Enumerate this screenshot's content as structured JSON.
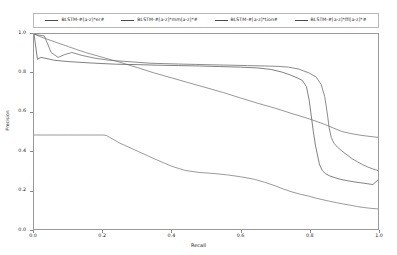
{
  "chart_data": {
    "type": "line",
    "title": "",
    "xlabel": "Recall",
    "ylabel": "Precision",
    "xlim": [
      0.0,
      1.0
    ],
    "ylim": [
      0.0,
      1.0
    ],
    "xticks": [
      "0.0",
      "0.2",
      "0.4",
      "0.6",
      "0.8",
      "1.0"
    ],
    "yticks": [
      "0.0",
      "0.2",
      "0.4",
      "0.6",
      "0.8",
      "1.0"
    ],
    "grid": false,
    "legend_position": "upper-center-outside",
    "series": [
      {
        "name": "BLSTM-#[a-z]*er#",
        "color": "#4a4a4a",
        "points": [
          [
            0.0,
            1.0
          ],
          [
            0.01,
            0.87
          ],
          [
            0.02,
            0.88
          ],
          [
            0.035,
            0.875
          ],
          [
            0.06,
            0.865
          ],
          [
            0.09,
            0.86
          ],
          [
            0.13,
            0.855
          ],
          [
            0.18,
            0.85
          ],
          [
            0.24,
            0.845
          ],
          [
            0.3,
            0.843
          ],
          [
            0.36,
            0.84
          ],
          [
            0.42,
            0.838
          ],
          [
            0.48,
            0.836
          ],
          [
            0.54,
            0.833
          ],
          [
            0.6,
            0.83
          ],
          [
            0.65,
            0.826
          ],
          [
            0.69,
            0.818
          ],
          [
            0.72,
            0.805
          ],
          [
            0.745,
            0.79
          ],
          [
            0.765,
            0.775
          ],
          [
            0.78,
            0.762
          ],
          [
            0.792,
            0.73
          ],
          [
            0.8,
            0.66
          ],
          [
            0.806,
            0.58
          ],
          [
            0.812,
            0.5
          ],
          [
            0.818,
            0.43
          ],
          [
            0.824,
            0.38
          ],
          [
            0.83,
            0.33
          ],
          [
            0.838,
            0.3
          ],
          [
            0.848,
            0.283
          ],
          [
            0.86,
            0.272
          ],
          [
            0.875,
            0.263
          ],
          [
            0.89,
            0.255
          ],
          [
            0.91,
            0.248
          ],
          [
            0.93,
            0.242
          ],
          [
            0.95,
            0.237
          ],
          [
            0.97,
            0.232
          ],
          [
            0.985,
            0.228
          ],
          [
            1.0,
            0.252
          ]
        ]
      },
      {
        "name": "BLSTM-#[a-z]*mm[a-z]*#",
        "color": "#5a5a5a",
        "points": [
          [
            0.0,
            1.0
          ],
          [
            0.012,
            0.995
          ],
          [
            0.03,
            0.99
          ],
          [
            0.05,
            0.905
          ],
          [
            0.07,
            0.88
          ],
          [
            0.09,
            0.895
          ],
          [
            0.11,
            0.905
          ],
          [
            0.14,
            0.89
          ],
          [
            0.18,
            0.875
          ],
          [
            0.22,
            0.865
          ],
          [
            0.26,
            0.86
          ],
          [
            0.3,
            0.855
          ],
          [
            0.34,
            0.85
          ],
          [
            0.38,
            0.848
          ],
          [
            0.42,
            0.846
          ],
          [
            0.47,
            0.844
          ],
          [
            0.52,
            0.842
          ],
          [
            0.57,
            0.84
          ],
          [
            0.62,
            0.838
          ],
          [
            0.67,
            0.836
          ],
          [
            0.71,
            0.834
          ],
          [
            0.74,
            0.83
          ],
          [
            0.77,
            0.82
          ],
          [
            0.8,
            0.8
          ],
          [
            0.82,
            0.78
          ],
          [
            0.835,
            0.74
          ],
          [
            0.845,
            0.68
          ],
          [
            0.852,
            0.6
          ],
          [
            0.858,
            0.52
          ],
          [
            0.864,
            0.47
          ],
          [
            0.872,
            0.44
          ],
          [
            0.882,
            0.42
          ],
          [
            0.895,
            0.4
          ],
          [
            0.91,
            0.38
          ],
          [
            0.925,
            0.36
          ],
          [
            0.94,
            0.345
          ],
          [
            0.955,
            0.33
          ],
          [
            0.97,
            0.318
          ],
          [
            0.985,
            0.308
          ],
          [
            1.0,
            0.3
          ]
        ]
      },
      {
        "name": "BLSTM-#[a-z]*tion#",
        "color": "#6a6a6a",
        "points": [
          [
            0.0,
            1.0
          ],
          [
            0.02,
            0.985
          ],
          [
            0.06,
            0.96
          ],
          [
            0.1,
            0.935
          ],
          [
            0.15,
            0.905
          ],
          [
            0.2,
            0.88
          ],
          [
            0.25,
            0.855
          ],
          [
            0.3,
            0.828
          ],
          [
            0.35,
            0.8
          ],
          [
            0.4,
            0.775
          ],
          [
            0.45,
            0.75
          ],
          [
            0.5,
            0.725
          ],
          [
            0.55,
            0.7
          ],
          [
            0.6,
            0.672
          ],
          [
            0.65,
            0.645
          ],
          [
            0.7,
            0.62
          ],
          [
            0.75,
            0.592
          ],
          [
            0.8,
            0.565
          ],
          [
            0.84,
            0.54
          ],
          [
            0.87,
            0.518
          ],
          [
            0.895,
            0.5
          ],
          [
            0.92,
            0.49
          ],
          [
            0.945,
            0.482
          ],
          [
            0.97,
            0.476
          ],
          [
            1.0,
            0.47
          ]
        ]
      },
      {
        "name": "BLSTM-#[a-z]*ffl[a-z]*#",
        "color": "#6e6e6e",
        "points": [
          [
            0.0,
            0.482
          ],
          [
            0.05,
            0.482
          ],
          [
            0.1,
            0.482
          ],
          [
            0.15,
            0.482
          ],
          [
            0.2,
            0.482
          ],
          [
            0.21,
            0.48
          ],
          [
            0.25,
            0.44
          ],
          [
            0.3,
            0.4
          ],
          [
            0.35,
            0.36
          ],
          [
            0.4,
            0.322
          ],
          [
            0.44,
            0.3
          ],
          [
            0.48,
            0.29
          ],
          [
            0.52,
            0.285
          ],
          [
            0.56,
            0.278
          ],
          [
            0.6,
            0.268
          ],
          [
            0.64,
            0.255
          ],
          [
            0.67,
            0.24
          ],
          [
            0.7,
            0.222
          ],
          [
            0.725,
            0.205
          ],
          [
            0.75,
            0.19
          ],
          [
            0.775,
            0.178
          ],
          [
            0.8,
            0.168
          ],
          [
            0.82,
            0.158
          ],
          [
            0.84,
            0.15
          ],
          [
            0.86,
            0.142
          ],
          [
            0.88,
            0.135
          ],
          [
            0.9,
            0.128
          ],
          [
            0.92,
            0.122
          ],
          [
            0.94,
            0.115
          ],
          [
            0.96,
            0.11
          ],
          [
            0.98,
            0.106
          ],
          [
            1.0,
            0.103
          ]
        ]
      }
    ]
  },
  "legend": {
    "entries": [
      {
        "label": "BLSTM-#[a-z]*er#"
      },
      {
        "label": "BLSTM-#[a-z]*mm[a-z]*#"
      },
      {
        "label": "BLSTM-#[a-z]*tion#"
      },
      {
        "label": "BLSTM-#[a-z]*ffl[a-z]*#"
      }
    ]
  },
  "axes": {
    "x_label": "Recall",
    "y_label": "Precision",
    "x_ticks": [
      "0.0",
      "0.2",
      "0.4",
      "0.6",
      "0.8",
      "1.0"
    ],
    "y_ticks": [
      "0.0",
      "0.2",
      "0.4",
      "0.6",
      "0.8",
      "1.0"
    ]
  }
}
